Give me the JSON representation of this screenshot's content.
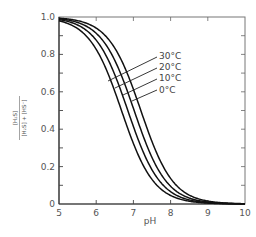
{
  "chart_data": {
    "type": "line",
    "title": "",
    "xlabel": "pH",
    "ylabel": "[H2S] / ([H2S] + [HS-])",
    "ylabel_parts": {
      "numerator": "[H₂S]",
      "denominator": "[H₂S] + [HS⁻]"
    },
    "xlim": [
      5,
      10
    ],
    "ylim": [
      0,
      1.0
    ],
    "xticks": [
      5,
      6,
      7,
      8,
      9,
      10
    ],
    "xtick_labels": [
      "5",
      "6",
      "7",
      "8",
      "9",
      "10"
    ],
    "yticks": [
      0,
      0.2,
      0.4,
      0.6,
      0.8,
      1.0
    ],
    "ytick_labels": [
      "0",
      "0.2",
      "0.4",
      "0.6",
      "0.8",
      "1.0"
    ],
    "yminor_step": 0.1,
    "grid": false,
    "legend_position": "inline-labels-with-leader-lines",
    "x": [
      5.0,
      5.5,
      6.0,
      6.25,
      6.5,
      6.75,
      7.0,
      7.25,
      7.5,
      7.75,
      8.0,
      8.5,
      9.0,
      9.5,
      10.0
    ],
    "series": [
      {
        "name": "30°C",
        "pKa": 6.68,
        "values": [
          0.98,
          0.94,
          0.83,
          0.73,
          0.6,
          0.46,
          0.32,
          0.21,
          0.13,
          0.08,
          0.05,
          0.02,
          0.005,
          0.002,
          0.0
        ]
      },
      {
        "name": "20°C",
        "pKa": 6.85,
        "values": [
          0.99,
          0.96,
          0.88,
          0.8,
          0.69,
          0.56,
          0.41,
          0.28,
          0.18,
          0.11,
          0.07,
          0.02,
          0.007,
          0.002,
          0.0
        ]
      },
      {
        "name": "10°C",
        "pKa": 7.02,
        "values": [
          0.99,
          0.97,
          0.91,
          0.85,
          0.77,
          0.65,
          0.51,
          0.37,
          0.25,
          0.16,
          0.1,
          0.03,
          0.01,
          0.003,
          0.0
        ]
      },
      {
        "name": "0°C",
        "pKa": 7.2,
        "values": [
          0.99,
          0.98,
          0.94,
          0.9,
          0.83,
          0.74,
          0.61,
          0.47,
          0.33,
          0.22,
          0.14,
          0.05,
          0.016,
          0.005,
          0.0
        ]
      }
    ]
  },
  "legend": {
    "labels": [
      "30°C",
      "20°C",
      "10°C",
      "0°C"
    ]
  }
}
